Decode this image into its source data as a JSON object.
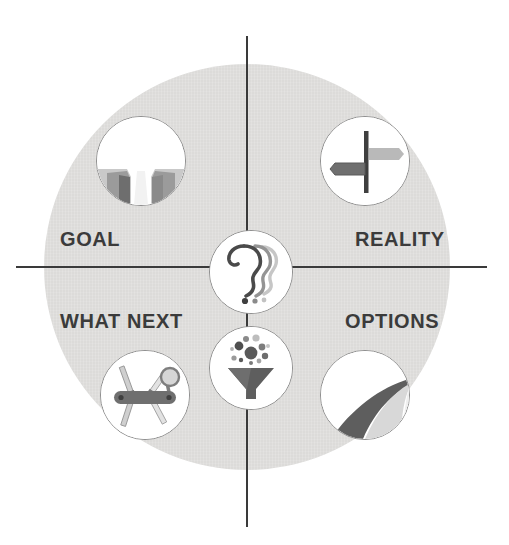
{
  "diagram": {
    "background_color": "#ffffff",
    "disc_color": "#dcdbd9",
    "axis_color": "#3a3a3a",
    "label_color": "#3b3b3b",
    "quadrants": [
      {
        "id": "goal",
        "label": "GOAL",
        "position": "top-left",
        "icon_name": "path-between-cliffs-icon",
        "icon_colors": [
          "#9a9a9a",
          "#6e6e6e",
          "#c4c4c4"
        ]
      },
      {
        "id": "reality",
        "label": "REALITY",
        "position": "top-right",
        "icon_name": "signpost-icon",
        "icon_colors": [
          "#4a4a4a",
          "#7d7d7d",
          "#b9b9b9"
        ]
      },
      {
        "id": "what-next",
        "label": "WHAT NEXT",
        "position": "bottom-left",
        "icon_name": "multi-tool-knife-icon",
        "icon_colors": [
          "#6f6f6f",
          "#a8a8a8",
          "#d0d0d0"
        ]
      },
      {
        "id": "options",
        "label": "OPTIONS",
        "position": "bottom-right",
        "icon_name": "winding-road-icon",
        "icon_colors": [
          "#5e5e5e",
          "#9b9b9b",
          "#cfcfcf"
        ]
      }
    ],
    "center_icons": [
      {
        "id": "center-heads",
        "icon_name": "question-head-profiles-icon",
        "description": "three overlapping head profiles with question mark",
        "icon_colors": [
          "#4a4a4a",
          "#8a8a8a",
          "#c0c0c0"
        ]
      },
      {
        "id": "center-funnel",
        "icon_name": "funnel-ideas-icon",
        "description": "funnel with dots filtering through",
        "icon_colors": [
          "#5a5a5a",
          "#8a8a8a",
          "#bdbdbd"
        ]
      }
    ]
  }
}
